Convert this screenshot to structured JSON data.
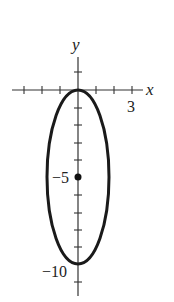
{
  "figure": {
    "type": "ellipse-graph",
    "axes": {
      "x_label": "x",
      "y_label": "y",
      "x_tick_label": "3",
      "y_tick_labels": [
        "-5",
        "-10"
      ],
      "x_ticks": [
        -3,
        -2,
        -1,
        1,
        2,
        3
      ],
      "y_ticks": [
        1,
        -1,
        -2,
        -3,
        -4,
        -5,
        -6,
        -7,
        -8,
        -9,
        -10,
        -11
      ]
    },
    "ellipse": {
      "center": [
        0,
        -5
      ],
      "semi_axis_x": 1.73,
      "semi_axis_y": 5,
      "equation": "x^2/3 + (y+5)^2/25 = 1"
    },
    "center_point_label": "-5",
    "colors": {
      "curve": "#1a1a1a",
      "axis": "#333333",
      "background": "#ffffff"
    }
  }
}
